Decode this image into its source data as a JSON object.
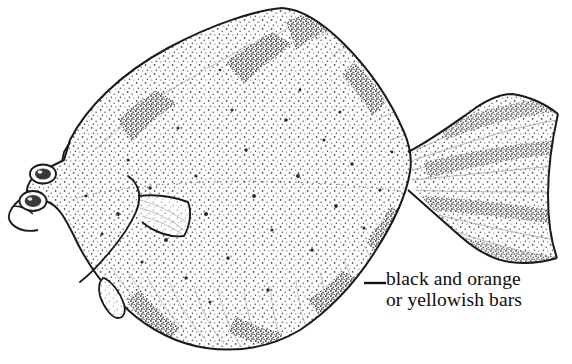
{
  "figure": {
    "common_name_implied": "turbot / flounder (flatfish)",
    "orientation": "left-facing head, tail to the right",
    "style": "black-and-white stippled line drawing",
    "background_color": "#ffffff",
    "ink_color": "#1a1a1a",
    "stipple_color": "#3a3a3a"
  },
  "annotation": {
    "line1": "black and orange",
    "line2": "or yellowish bars",
    "leader_label": "leader-line-to-anal-fin",
    "text_color": "#100d0b",
    "font_size_px": 19.5,
    "position": {
      "x": 386,
      "y": 268
    }
  },
  "anatomy": {
    "parts": [
      {
        "name": "body",
        "label": "body"
      },
      {
        "name": "dorsal-fin",
        "label": "dorsal fin"
      },
      {
        "name": "anal-fin",
        "label": "anal fin"
      },
      {
        "name": "caudal-fin",
        "label": "caudal fin"
      },
      {
        "name": "pectoral-fin",
        "label": "pectoral fin"
      },
      {
        "name": "pelvic-fin",
        "label": "pelvic fin"
      },
      {
        "name": "upper-eye",
        "label": "upper eye"
      },
      {
        "name": "lower-eye",
        "label": "lower eye"
      },
      {
        "name": "mouth",
        "label": "mouth"
      },
      {
        "name": "gill-cover",
        "label": "gill cover"
      },
      {
        "name": "lateral-line",
        "label": "lateral line"
      },
      {
        "name": "caudal-peduncle",
        "label": "caudal peduncle"
      }
    ]
  },
  "markings": {
    "dorsal_bars_count": 4,
    "anal_bars_count": 4,
    "caudal_bars_count": 4,
    "description": "dark stippled bars along dorsal, anal and caudal fins"
  }
}
